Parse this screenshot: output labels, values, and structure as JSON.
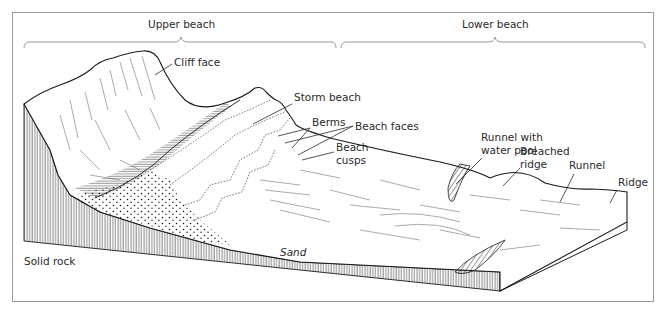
{
  "diagram": {
    "zones": [
      {
        "label": "Upper beach"
      },
      {
        "label": "Lower beach"
      }
    ],
    "labels": {
      "cliff_face": "Cliff face",
      "storm_beach": "Storm beach",
      "berms": "Berms",
      "beach_faces": "Beach faces",
      "beach_cusps_1": "Beach",
      "beach_cusps_2": "cusps",
      "runnel_pool_1": "Runnel with",
      "runnel_pool_2": "water pool",
      "breached_ridge_1": "Breached",
      "breached_ridge_2": "ridge",
      "runnel": "Runnel",
      "ridge": "Ridge",
      "solid_rock": "Solid rock",
      "sand": "Sand"
    },
    "colors": {
      "line": "#1a1a1a",
      "text": "#2a2a2a",
      "frame": "#9a9a9a",
      "brace": "#8a8a8a"
    }
  }
}
